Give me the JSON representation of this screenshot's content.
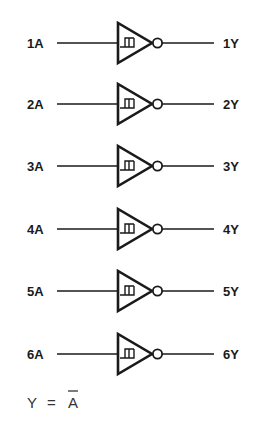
{
  "diagram": {
    "gate_type": "schmitt-trigger-inverter",
    "gates": [
      {
        "input": "1A",
        "output": "1Y",
        "y": 43
      },
      {
        "input": "2A",
        "output": "2Y",
        "y": 104
      },
      {
        "input": "3A",
        "output": "3Y",
        "y": 166
      },
      {
        "input": "4A",
        "output": "4Y",
        "y": 229
      },
      {
        "input": "5A",
        "output": "5Y",
        "y": 291
      },
      {
        "input": "6A",
        "output": "6Y",
        "y": 354
      }
    ],
    "equation": {
      "lhs": "Y",
      "op": "=",
      "rhs": "A",
      "rhs_overline": true
    },
    "colors": {
      "stroke": "#1a1a1a",
      "background": "#ffffff"
    }
  }
}
